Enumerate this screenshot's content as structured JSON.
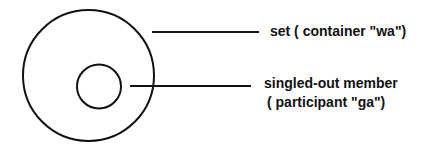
{
  "diagram": {
    "type": "set-membership",
    "stroke_color": "#111111",
    "background_color": "#ffffff",
    "shapes": {
      "outer_circle": {
        "cx": 88.5,
        "cy": 75.5,
        "r": 65.5,
        "represents": "set"
      },
      "inner_circle": {
        "cx": 99,
        "cy": 86.5,
        "r": 22,
        "represents": "singled-out member"
      }
    },
    "leaders": [
      {
        "x1": 152,
        "y1": 32,
        "x2": 259,
        "y2": 32,
        "points_to": "set"
      },
      {
        "x1": 130,
        "y1": 86,
        "x2": 251,
        "y2": 86,
        "points_to": "singled-out member"
      }
    ],
    "labels": {
      "set": "set ( container \"wa\")",
      "member_line1": "singled-out member",
      "member_line2": "( participant \"ga\")"
    }
  }
}
